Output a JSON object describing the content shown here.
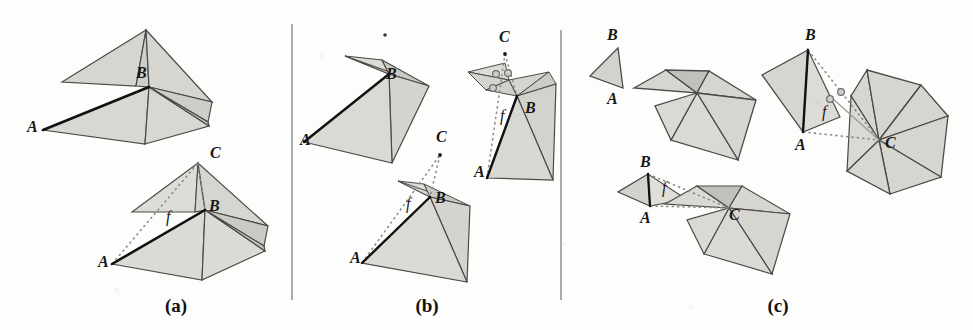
{
  "figure": {
    "background_color": "#fdfdfc",
    "face_fill": "#d7d5d0",
    "face_fill_dark": "#bcbab5",
    "face_fill_light": "#e4e2de",
    "stroke_color": "#4a4a4a",
    "bold_stroke_color": "#111111",
    "dotted_stroke_color": "#8a8a8a",
    "divider_color": "#8f8f8f",
    "marker_fill": "#cfcdc8",
    "marker_stroke": "#6e6e6e"
  },
  "panels": [
    {
      "id": "a",
      "caption": "(a)",
      "caption_x": 176,
      "caption_y": 312,
      "labels": [
        {
          "name": "label-a-top-B",
          "text": "B",
          "x": 136,
          "y": 78
        },
        {
          "name": "label-a-top-A",
          "text": "A",
          "x": 27,
          "y": 132
        },
        {
          "name": "label-a-bottom-C",
          "text": "C",
          "x": 210,
          "y": 158
        },
        {
          "name": "label-a-bottom-B",
          "text": "B",
          "x": 209,
          "y": 211
        },
        {
          "name": "label-a-bottom-A",
          "text": "A",
          "x": 98,
          "y": 267
        },
        {
          "name": "label-a-bottom-f",
          "text": "f",
          "x": 166,
          "y": 222
        }
      ]
    },
    {
      "id": "b",
      "caption": "(b)",
      "caption_x": 427,
      "caption_y": 312,
      "labels": [
        {
          "name": "label-b-tl-B",
          "text": "B",
          "x": 386,
          "y": 79
        },
        {
          "name": "label-b-tl-A",
          "text": "A",
          "x": 300,
          "y": 145
        },
        {
          "name": "label-b-tr-C",
          "text": "C",
          "x": 499,
          "y": 42
        },
        {
          "name": "label-b-tr-B",
          "text": "B",
          "x": 525,
          "y": 113
        },
        {
          "name": "label-b-tr-A",
          "text": "A",
          "x": 474,
          "y": 177
        },
        {
          "name": "label-b-tr-f",
          "text": "f",
          "x": 500,
          "y": 121
        },
        {
          "name": "label-b-bot-C",
          "text": "C",
          "x": 436,
          "y": 142
        },
        {
          "name": "label-b-bot-B",
          "text": "B",
          "x": 435,
          "y": 203
        },
        {
          "name": "label-b-bot-A",
          "text": "A",
          "x": 350,
          "y": 263
        },
        {
          "name": "label-b-bot-f",
          "text": "f",
          "x": 406,
          "y": 209
        }
      ]
    },
    {
      "id": "c",
      "caption": "(c)",
      "caption_x": 778,
      "caption_y": 312,
      "labels": [
        {
          "name": "label-c-tl-B",
          "text": "B",
          "x": 607,
          "y": 40
        },
        {
          "name": "label-c-tl-A",
          "text": "A",
          "x": 607,
          "y": 92
        },
        {
          "name": "label-c-tr-B",
          "text": "B",
          "x": 805,
          "y": 40
        },
        {
          "name": "label-c-tr-A",
          "text": "A",
          "x": 795,
          "y": 147
        },
        {
          "name": "label-c-tr-C",
          "text": "C",
          "x": 890,
          "y": 146
        },
        {
          "name": "label-c-tr-f",
          "text": "f",
          "x": 822,
          "y": 117
        },
        {
          "name": "label-c-bl-B",
          "text": "B",
          "x": 642,
          "y": 166
        },
        {
          "name": "label-c-bl-A",
          "text": "A",
          "x": 642,
          "y": 213
        },
        {
          "name": "label-c-bl-C",
          "text": "C",
          "x": 734,
          "y": 219
        },
        {
          "name": "label-c-bl-f",
          "text": "f",
          "x": 662,
          "y": 193
        }
      ]
    }
  ],
  "dividers": [
    {
      "name": "panel-divider-1",
      "x": 292,
      "y1": 24,
      "y2": 300
    },
    {
      "name": "panel-divider-2",
      "x": 561,
      "y1": 30,
      "y2": 300
    }
  ],
  "stray_marks": [
    {
      "name": "stray-dot-b",
      "x": 385,
      "y": 35,
      "r": 1.8
    }
  ]
}
